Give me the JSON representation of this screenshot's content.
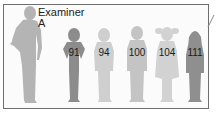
{
  "examiner": {
    "line1": "Examiner",
    "line2": "A"
  },
  "children": [
    {
      "label": "91",
      "color": "#8c8c8c"
    },
    {
      "label": "94",
      "color": "#cfcfcf"
    },
    {
      "label": "100",
      "color": "#c4c4c4"
    },
    {
      "label": "104",
      "color": "#d2d2d2"
    },
    {
      "label": "111",
      "color": "#8f8f8f"
    }
  ],
  "colors": {
    "examiner": "#b4b4b4",
    "border": "#6e6e6e"
  }
}
